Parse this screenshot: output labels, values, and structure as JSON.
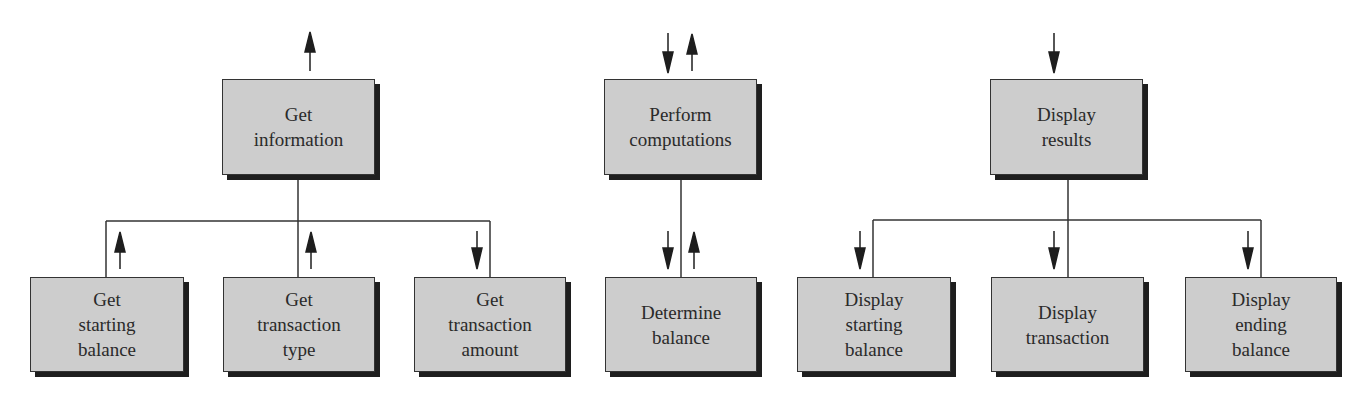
{
  "modules": [
    {
      "id": "get-information",
      "lines": [
        "Get",
        "information"
      ],
      "level": 1
    },
    {
      "id": "perform-computations",
      "lines": [
        "Perform",
        "computations"
      ],
      "level": 1
    },
    {
      "id": "display-results",
      "lines": [
        "Display",
        "results"
      ],
      "level": 1
    },
    {
      "id": "get-starting-balance",
      "lines": [
        "Get",
        "starting",
        "balance"
      ],
      "level": 2,
      "parent": "get-information",
      "data_flow": "up"
    },
    {
      "id": "get-transaction-type",
      "lines": [
        "Get",
        "transaction",
        "type"
      ],
      "level": 2,
      "parent": "get-information",
      "data_flow": "up"
    },
    {
      "id": "get-transaction-amount",
      "lines": [
        "Get",
        "transaction",
        "amount"
      ],
      "level": 2,
      "parent": "get-information",
      "data_flow": "down"
    },
    {
      "id": "determine-balance",
      "lines": [
        "Determine",
        "balance"
      ],
      "level": 2,
      "parent": "perform-computations",
      "data_flow": "down-and-up"
    },
    {
      "id": "display-starting-balance",
      "lines": [
        "Display",
        "starting",
        "balance"
      ],
      "level": 2,
      "parent": "display-results",
      "data_flow": "down"
    },
    {
      "id": "display-transaction",
      "lines": [
        "Display",
        "transaction"
      ],
      "level": 2,
      "parent": "display-results",
      "data_flow": "down"
    },
    {
      "id": "display-ending-balance",
      "lines": [
        "Display",
        "ending",
        "balance"
      ],
      "level": 2,
      "parent": "display-results",
      "data_flow": "down"
    }
  ],
  "top_flows": {
    "get-information": "up",
    "perform-computations": "down-and-up",
    "display-results": "down"
  },
  "colors": {
    "box_fill": "#cdcdcd",
    "box_border": "#333333",
    "shadow": "#1e1e1e",
    "line": "#333333",
    "text": "#2a2a2a"
  }
}
